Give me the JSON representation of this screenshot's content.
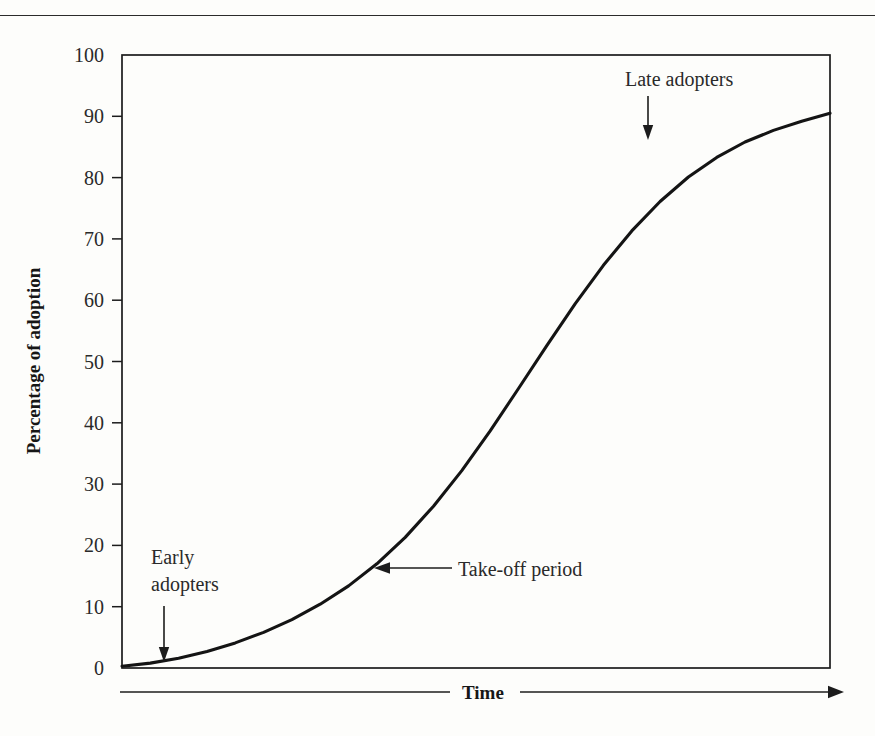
{
  "page": {
    "has_top_rule": true,
    "background_color": "#fdfdfb",
    "ink_color": "#1a1a1a"
  },
  "chart_data": {
    "type": "line",
    "title": "",
    "subtitle": "",
    "xlabel": "Time",
    "ylabel": "Percentage of adoption",
    "xlim": [
      0,
      100
    ],
    "ylim": [
      0,
      100
    ],
    "grid": false,
    "legend": null,
    "x_axis": {
      "label": "Time",
      "tick_labels": [],
      "style": "arrow-right",
      "note": "unlabeled time axis drawn as a horizontal arrow beneath the plot"
    },
    "y_axis": {
      "label": "Percentage of adoption",
      "ticks": [
        0,
        10,
        20,
        30,
        40,
        50,
        60,
        70,
        80,
        90,
        100
      ],
      "tick_labels": [
        "0",
        "10",
        "20",
        "30",
        "40",
        "50",
        "60",
        "70",
        "80",
        "90",
        "100"
      ]
    },
    "series": [
      {
        "name": "Cumulative adoption (S-curve)",
        "x": [
          0,
          4,
          8,
          12,
          16,
          20,
          24,
          28,
          32,
          36,
          40,
          44,
          48,
          52,
          56,
          60,
          64,
          68,
          72,
          76,
          80,
          84,
          88,
          92,
          96,
          100
        ],
        "values": [
          0.3,
          0.8,
          1.6,
          2.7,
          4.1,
          5.8,
          7.9,
          10.4,
          13.4,
          17.0,
          21.3,
          26.4,
          32.2,
          38.7,
          45.6,
          52.6,
          59.4,
          65.7,
          71.3,
          76.1,
          80.1,
          83.3,
          85.8,
          87.7,
          89.2,
          90.5
        ]
      }
    ],
    "annotations": [
      {
        "id": "early-adopters",
        "text_lines": [
          "Early",
          "adopters"
        ],
        "arrow": "down",
        "points_at_percent": 1.5
      },
      {
        "id": "take-off-period",
        "text_lines": [
          "Take-off period"
        ],
        "arrow": "left",
        "points_at_percent": 17
      },
      {
        "id": "late-adopters",
        "text_lines": [
          "Late adopters"
        ],
        "arrow": "down",
        "points_at_percent": 87
      }
    ]
  },
  "labels": {
    "y_tick_100": "100",
    "y_tick_90": "90",
    "y_tick_80": "80",
    "y_tick_70": "70",
    "y_tick_60": "60",
    "y_tick_50": "50",
    "y_tick_40": "40",
    "y_tick_30": "30",
    "y_tick_20": "20",
    "y_tick_10": "10",
    "y_tick_0": "0",
    "y_axis_title": "Percentage of adoption",
    "x_axis_title": "Time",
    "anno_early_line1": "Early",
    "anno_early_line2": "adopters",
    "anno_takeoff": "Take-off period",
    "anno_late": "Late adopters"
  }
}
